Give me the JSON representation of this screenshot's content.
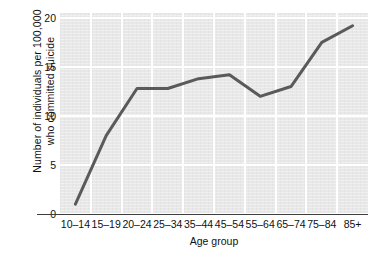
{
  "chart_data": {
    "type": "line",
    "title": "",
    "subtitle": "",
    "xlabel": "Age group",
    "ylabel": "Number of individuals per 100,000 who committed suicide",
    "ylabel_line1": "Number of individuals per 100,000",
    "ylabel_line2": "who committed suicide",
    "categories": [
      "10–14",
      "15–19",
      "20–24",
      "25–34",
      "35–44",
      "45–54",
      "55–64",
      "65–74",
      "75–84",
      "85+"
    ],
    "values": [
      1,
      8,
      12.8,
      12.8,
      13.8,
      14.2,
      12,
      13,
      17.5,
      19.2
    ],
    "ylim": [
      0,
      20.5
    ],
    "yticks": [
      0,
      5,
      10,
      15,
      20
    ],
    "ytick_labels": [
      "0",
      "5",
      "10",
      "15",
      "20"
    ],
    "grid": true,
    "grid_color": "#ffffff",
    "legend": null,
    "legend_position": "none",
    "series": [
      {
        "name": "Suicide rate",
        "values": [
          1,
          8,
          12.8,
          12.8,
          13.8,
          14.2,
          12,
          13,
          17.5,
          19.2
        ],
        "color": "#5a5a5a",
        "line_width": 3,
        "markers": false
      }
    ]
  },
  "style": {
    "plot_background": "#e8e8e8",
    "page_background": "#ffffff",
    "axis_color": "#3d3d3d",
    "text_color": "#111111",
    "line_color": "#5a5a5a"
  }
}
